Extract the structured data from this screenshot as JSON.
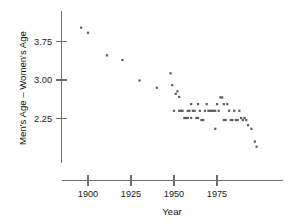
{
  "chart_data": {
    "type": "scatter",
    "title": "",
    "xlabel": "Year",
    "ylabel": "Men's Age – Women's Age",
    "xlim": [
      1890,
      2000
    ],
    "ylim": [
      1.55,
      4.15
    ],
    "grid": false,
    "legend": null,
    "xticks": [
      1900,
      1925,
      1950,
      1975
    ],
    "xticklabels": [
      "1900",
      "1925",
      "1950",
      "1975"
    ],
    "yticks": [
      2.25,
      3.0,
      3.75
    ],
    "yticklabels": [
      "2.25",
      "3.00",
      "3.75"
    ],
    "marker": {
      "shape": "square",
      "size_px": 2.2,
      "color": "#5b5b5b"
    },
    "points": [
      {
        "x": 1896,
        "y": 4.02
      },
      {
        "x": 1900,
        "y": 3.92
      },
      {
        "x": 1911,
        "y": 3.48
      },
      {
        "x": 1920,
        "y": 3.39
      },
      {
        "x": 1930,
        "y": 2.99
      },
      {
        "x": 1940,
        "y": 2.85
      },
      {
        "x": 1948,
        "y": 3.13
      },
      {
        "x": 1949,
        "y": 2.9
      },
      {
        "x": 1950,
        "y": 2.4
      },
      {
        "x": 1951,
        "y": 2.73
      },
      {
        "x": 1952,
        "y": 2.78
      },
      {
        "x": 1953,
        "y": 2.67
      },
      {
        "x": 1953,
        "y": 2.4
      },
      {
        "x": 1954,
        "y": 2.4
      },
      {
        "x": 1955,
        "y": 2.4
      },
      {
        "x": 1956,
        "y": 2.26
      },
      {
        "x": 1957,
        "y": 2.26
      },
      {
        "x": 1958,
        "y": 2.4
      },
      {
        "x": 1958,
        "y": 2.26
      },
      {
        "x": 1959,
        "y": 2.4
      },
      {
        "x": 1960,
        "y": 2.53
      },
      {
        "x": 1960,
        "y": 2.26
      },
      {
        "x": 1961,
        "y": 2.4
      },
      {
        "x": 1962,
        "y": 2.4
      },
      {
        "x": 1963,
        "y": 2.26
      },
      {
        "x": 1964,
        "y": 2.53
      },
      {
        "x": 1964,
        "y": 2.26
      },
      {
        "x": 1965,
        "y": 2.4
      },
      {
        "x": 1966,
        "y": 2.22
      },
      {
        "x": 1967,
        "y": 2.22
      },
      {
        "x": 1968,
        "y": 2.4
      },
      {
        "x": 1969,
        "y": 2.53
      },
      {
        "x": 1970,
        "y": 2.4
      },
      {
        "x": 1971,
        "y": 2.4
      },
      {
        "x": 1972,
        "y": 2.4
      },
      {
        "x": 1973,
        "y": 2.4
      },
      {
        "x": 1974,
        "y": 2.4
      },
      {
        "x": 1974,
        "y": 2.05
      },
      {
        "x": 1975,
        "y": 2.53
      },
      {
        "x": 1976,
        "y": 2.4
      },
      {
        "x": 1977,
        "y": 2.66
      },
      {
        "x": 1978,
        "y": 2.66
      },
      {
        "x": 1979,
        "y": 2.53
      },
      {
        "x": 1979,
        "y": 2.22
      },
      {
        "x": 1980,
        "y": 2.22
      },
      {
        "x": 1981,
        "y": 2.53
      },
      {
        "x": 1982,
        "y": 2.4
      },
      {
        "x": 1983,
        "y": 2.22
      },
      {
        "x": 1984,
        "y": 2.22
      },
      {
        "x": 1985,
        "y": 2.4
      },
      {
        "x": 1986,
        "y": 2.22
      },
      {
        "x": 1987,
        "y": 2.22
      },
      {
        "x": 1988,
        "y": 2.4
      },
      {
        "x": 1989,
        "y": 2.26
      },
      {
        "x": 1990,
        "y": 2.22
      },
      {
        "x": 1991,
        "y": 2.26
      },
      {
        "x": 1992,
        "y": 2.22
      },
      {
        "x": 1993,
        "y": 2.12
      },
      {
        "x": 1995,
        "y": 2.05
      },
      {
        "x": 1997,
        "y": 1.8
      },
      {
        "x": 1998,
        "y": 1.7
      }
    ]
  },
  "axes": {
    "y_title": "Men's Age – Women's Age",
    "x_title": "Year",
    "y_labels": [
      "3.75",
      "3.00",
      "2.25"
    ],
    "x_labels": [
      "1900",
      "1925",
      "1950",
      "1975"
    ]
  }
}
